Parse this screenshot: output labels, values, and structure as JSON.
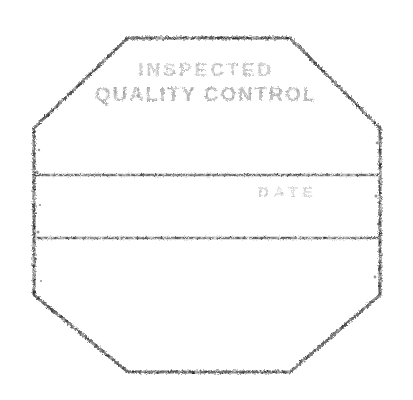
{
  "image": {
    "kind": "rubber-stamp-impression",
    "shape": "octagon",
    "condition": "faded, partially inked, broken strokes",
    "background_color": "#ffffff",
    "ink_color": "#2b2b2b",
    "width": 413,
    "height": 400
  },
  "stamp": {
    "border": {
      "name": "octagon-border",
      "stroke_color": "#2b2b2b",
      "stroke_width": 3,
      "top_edge_y": 38,
      "bottom_edge_y": 372,
      "left_edge_x": 34,
      "right_edge_x": 380,
      "corner_inset": 94
    },
    "rules": [
      {
        "name": "divider-rule-upper",
        "y": 175,
        "x_start": 36,
        "x_end": 378
      },
      {
        "name": "divider-rule-lower",
        "y": 238,
        "x_start": 36,
        "x_end": 378
      }
    ],
    "text_lines": [
      {
        "id": "line-1",
        "text": "INSPECTED",
        "legibility": "illegible",
        "opacity": 0.3
      },
      {
        "id": "line-2",
        "text": "QUALITY CONTROL",
        "legibility": "partially legible",
        "opacity": 0.42
      },
      {
        "id": "line-3",
        "text": "DATE",
        "legibility": "illegible",
        "opacity": 0.26
      }
    ],
    "compartments": [
      {
        "name": "upper-compartment",
        "content": "two stamped text lines"
      },
      {
        "name": "middle-compartment",
        "content": "one faded text fragment at right"
      },
      {
        "name": "lower-compartment",
        "content": "blank"
      }
    ]
  }
}
